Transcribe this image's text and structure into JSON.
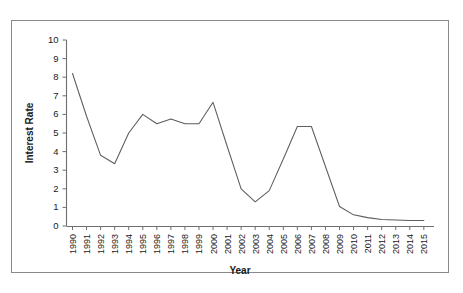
{
  "chart_data": {
    "type": "line",
    "title": "",
    "xlabel": "Year",
    "ylabel": "Interest Rate",
    "xlim": [
      1990,
      2015
    ],
    "ylim": [
      0,
      10
    ],
    "grid": false,
    "legend": "none",
    "ytick_labels": [
      "0",
      "1",
      "2",
      "3",
      "4",
      "5",
      "6",
      "7",
      "8",
      "9",
      "10"
    ],
    "ytick_values": [
      0,
      1,
      2,
      3,
      4,
      5,
      6,
      7,
      8,
      9,
      10
    ],
    "categories": [
      "1990",
      "1991",
      "1992",
      "1993",
      "1994",
      "1995",
      "1996",
      "1997",
      "1998",
      "1999",
      "2000",
      "2001",
      "2002",
      "2003",
      "2004",
      "2005",
      "2006",
      "2007",
      "2008",
      "2009",
      "2010",
      "2011",
      "2012",
      "2013",
      "2014",
      "2015"
    ],
    "x": [
      1990,
      1991,
      1992,
      1993,
      1994,
      1995,
      1996,
      1997,
      1998,
      1999,
      2000,
      2001,
      2002,
      2003,
      2004,
      2005,
      2006,
      2007,
      2008,
      2009,
      2010,
      2011,
      2012,
      2013,
      2014,
      2015
    ],
    "values": [
      8.2,
      5.9,
      3.8,
      3.35,
      5.0,
      6.0,
      5.5,
      5.75,
      5.5,
      5.5,
      6.65,
      4.3,
      2.0,
      1.3,
      1.9,
      3.6,
      5.35,
      5.35,
      3.2,
      1.05,
      0.6,
      0.45,
      0.35,
      0.32,
      0.3,
      0.3
    ],
    "series": [
      {
        "name": "Interest Rate",
        "color": "#5c5c5c",
        "values": [
          8.2,
          5.9,
          3.8,
          3.35,
          5.0,
          6.0,
          5.5,
          5.75,
          5.5,
          5.5,
          6.65,
          4.3,
          2.0,
          1.3,
          1.9,
          3.6,
          5.35,
          5.35,
          3.2,
          1.05,
          0.6,
          0.45,
          0.35,
          0.32,
          0.3,
          0.3
        ]
      }
    ]
  },
  "figure": {
    "background_color": "#ffffff",
    "frame_color": "#8a8a8a",
    "line_color": "#5c5c5c",
    "axis_color": "#6e6e6e"
  }
}
